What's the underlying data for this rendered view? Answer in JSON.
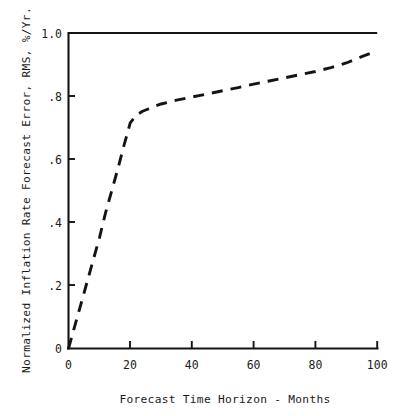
{
  "chart_data": {
    "type": "line",
    "title": "",
    "xlabel": "Forecast Time Horizon - Months",
    "ylabel": "Normalized Inflation Rate Forecast Error, RMS, %/Yr.",
    "xlim": [
      0,
      100
    ],
    "ylim": [
      0,
      1.0
    ],
    "grid": false,
    "legend": null,
    "xticks": [
      0,
      20,
      40,
      60,
      80,
      100
    ],
    "xticklabels": [
      "0",
      "20",
      "40",
      "60",
      "80",
      "100"
    ],
    "yticks": [
      0,
      0.2,
      0.4,
      0.6,
      0.8,
      1.0
    ],
    "yticklabels": [
      "0",
      ".2",
      ".4",
      ".6",
      ".8",
      "1.0"
    ],
    "series": [
      {
        "name": "reference-level",
        "style": "solid",
        "x": [
          0,
          100
        ],
        "values": [
          1.0,
          1.0
        ]
      },
      {
        "name": "normalized-forecast-error",
        "style": "dashed",
        "x": [
          0,
          2,
          4,
          6,
          8,
          10,
          12,
          14,
          16,
          18,
          20,
          22,
          24,
          26,
          28,
          30,
          35,
          40,
          45,
          50,
          55,
          60,
          65,
          70,
          75,
          80,
          85,
          90,
          95,
          99
        ],
        "values": [
          0.0,
          0.07,
          0.14,
          0.21,
          0.28,
          0.35,
          0.43,
          0.5,
          0.57,
          0.645,
          0.715,
          0.74,
          0.752,
          0.76,
          0.768,
          0.775,
          0.787,
          0.797,
          0.807,
          0.817,
          0.827,
          0.838,
          0.848,
          0.858,
          0.868,
          0.878,
          0.89,
          0.905,
          0.925,
          0.94
        ]
      }
    ]
  },
  "figure": {
    "background_color": "#ffffff",
    "ink_color": "#141414"
  }
}
